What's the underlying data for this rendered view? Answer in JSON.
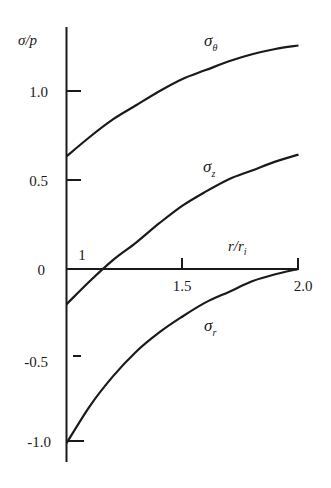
{
  "chart_data": {
    "type": "line",
    "title": "",
    "xlabel": "r/r_i",
    "ylabel": "σ/p",
    "xlim": [
      1.0,
      2.0
    ],
    "ylim": [
      -1.1,
      1.4
    ],
    "grid": false,
    "legend": "inline labels",
    "x_ticks": [
      1.5,
      2.0
    ],
    "x_tick_labels": [
      "1",
      "1.5",
      "2.0"
    ],
    "y_ticks": [
      -1.0,
      -0.5,
      0,
      0.5,
      1.0
    ],
    "y_tick_labels": [
      "-1.0",
      "-0.5",
      "0",
      "0.5",
      "1.0"
    ],
    "x": [
      1.0,
      1.1,
      1.2,
      1.3,
      1.4,
      1.5,
      1.6,
      1.7,
      1.8,
      1.9,
      2.0
    ],
    "series": [
      {
        "name": "σ_θ",
        "label": "σ",
        "subscript": "θ",
        "values": [
          0.64,
          0.75,
          0.85,
          0.93,
          1.01,
          1.08,
          1.13,
          1.18,
          1.22,
          1.25,
          1.27
        ]
      },
      {
        "name": "σ_z",
        "label": "σ",
        "subscript": "z",
        "values": [
          -0.2,
          -0.07,
          0.05,
          0.15,
          0.26,
          0.36,
          0.44,
          0.51,
          0.56,
          0.61,
          0.65
        ]
      },
      {
        "name": "σ_r",
        "label": "σ",
        "subscript": "r",
        "values": [
          -0.99,
          -0.78,
          -0.61,
          -0.47,
          -0.36,
          -0.27,
          -0.19,
          -0.13,
          -0.07,
          -0.03,
          0.0
        ]
      }
    ],
    "annotations": [
      "1"
    ]
  },
  "labels": {
    "ylabel": "σ/p",
    "xlabel_main": "r/r",
    "xlabel_sub": "i",
    "x_origin": "1",
    "x_tick_1": "1.5",
    "x_tick_2": "2.0",
    "y_tick_1": "1.0",
    "y_tick_05": "0.5",
    "y_tick_0": "0",
    "y_tick_m05": "-0.5",
    "y_tick_m1": "-1.0",
    "sigma": "σ",
    "sub_theta": "θ",
    "sub_z": "z",
    "sub_r": "r"
  }
}
